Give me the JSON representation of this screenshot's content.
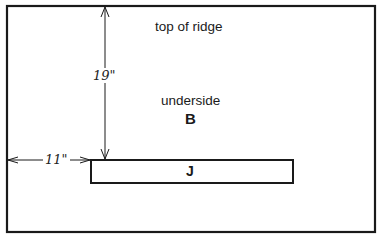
{
  "diagram": {
    "labels": {
      "top": "top of ridge",
      "underside": "underside",
      "board_b": "B",
      "board_j": "J"
    },
    "dimensions": {
      "vertical": "19\"",
      "horizontal": "11\""
    },
    "colors": {
      "line": "#1a1a1a",
      "background": "#ffffff"
    }
  }
}
